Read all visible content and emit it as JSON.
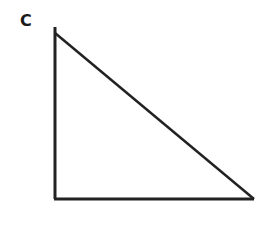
{
  "diagram": {
    "type": "right-triangle",
    "vertex_label": "C",
    "stroke_color": "#222222",
    "points": {
      "top": [
        55,
        33
      ],
      "right_angle": [
        55,
        199
      ],
      "bottom_right": [
        254,
        199
      ]
    }
  }
}
